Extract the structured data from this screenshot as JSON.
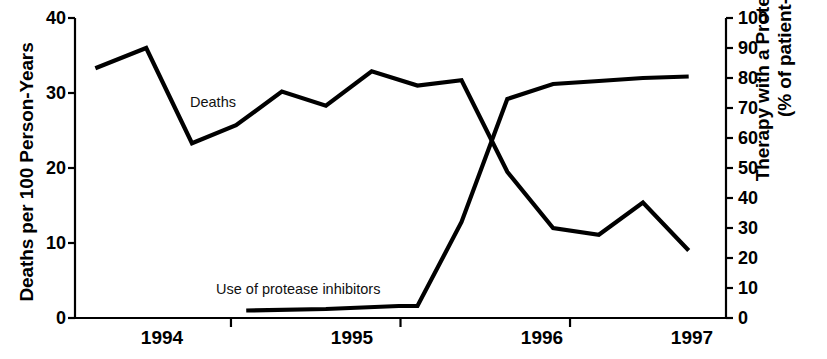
{
  "chart_data": {
    "type": "line",
    "title": "",
    "xlabel": "",
    "ylabel": "Deaths per 100 Person-Years",
    "y2label_line1": "Therapy with a Protease Inhibitor",
    "y2label_line2": "(% of patient-days)",
    "xlim": [
      1993.58,
      1997.42
    ],
    "ylim": [
      0,
      40
    ],
    "y2lim": [
      0,
      100
    ],
    "grid": false,
    "legend_position": "inline-labels",
    "xticks": [
      1994.5,
      1995.5,
      1996.5
    ],
    "xtick_labels": [
      "1994",
      "1995",
      "1996",
      "1997"
    ],
    "xtick_label_positions": [
      1994.0,
      1995.0,
      1996.0,
      1997.0
    ],
    "yticks_left": [
      0,
      10,
      20,
      30,
      40
    ],
    "ytick_labels_left": [
      "0",
      "10",
      "20",
      "30",
      "40"
    ],
    "yticks_right": [
      0,
      10,
      20,
      30,
      40,
      50,
      60,
      70,
      80,
      90,
      100
    ],
    "ytick_labels_right": [
      "0",
      "10",
      "20",
      "30",
      "40",
      "50",
      "60",
      "70",
      "80",
      "90",
      "100"
    ],
    "series": [
      {
        "name": "Deaths",
        "axis": "left",
        "units": "deaths per 100 person-years",
        "color": "#000000",
        "annotation": "Deaths",
        "annotation_x": 1994.2,
        "annotation_y": 27.5,
        "x": [
          1993.7,
          1994.0,
          1994.27,
          1994.53,
          1994.8,
          1995.06,
          1995.33,
          1995.6,
          1995.86,
          1996.13,
          1996.4,
          1996.67,
          1996.93,
          1997.2
        ],
        "values": [
          33.3,
          36.0,
          23.3,
          25.7,
          30.2,
          28.3,
          32.9,
          31.0,
          31.7,
          19.5,
          12.0,
          11.1,
          15.4,
          9.0
        ]
      },
      {
        "name": "Use of protease inhibitors",
        "axis": "right",
        "units": "% of patient-days",
        "color": "#000000",
        "annotation": "Use of protease inhibitors",
        "annotation_x": 1994.73,
        "annotation_y": 10.5,
        "x": [
          1994.59,
          1995.06,
          1995.49,
          1995.6,
          1995.86,
          1996.13,
          1996.4,
          1996.67,
          1996.93,
          1997.2
        ],
        "values": [
          2.5,
          3.0,
          4.0,
          4.0,
          32.0,
          73.0,
          78.0,
          79.0,
          80.0,
          80.5
        ]
      }
    ]
  },
  "axes": {
    "left_title": "Deaths per 100 Person-Years",
    "right_title_line1": "Therapy with a Protease Inhibitor",
    "right_title_line2": "(% of patient-days)"
  },
  "labels": {
    "deaths": "Deaths",
    "protease": "Use of protease inhibitors"
  },
  "ticks": {
    "left": [
      "40",
      "30",
      "20",
      "10",
      "0"
    ],
    "right": [
      "100",
      "90",
      "80",
      "70",
      "60",
      "50",
      "40",
      "30",
      "20",
      "10",
      "0"
    ],
    "x": [
      "1994",
      "1995",
      "1996",
      "1997"
    ]
  }
}
